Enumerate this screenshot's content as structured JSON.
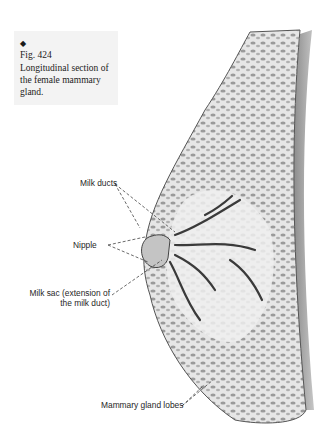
{
  "caption": {
    "marker": "◆",
    "figure": "Fig. 424",
    "text": "Longitudinal section of the female mammary gland."
  },
  "labels": {
    "milk_ducts": "Milk ducts",
    "nipple": "Nipple",
    "milk_sac_line1": "Milk sac (extension of",
    "milk_sac_line2": "the milk duct)",
    "mammary_gland_lobes": "Mammary gland lobes"
  },
  "colors": {
    "background": "#ffffff",
    "caption_bg": "#f3f3f3",
    "tissue_light": "#e8e8e8",
    "tissue_dark": "#8a8a8a",
    "outline": "#555555",
    "leader_line": "#444444"
  }
}
